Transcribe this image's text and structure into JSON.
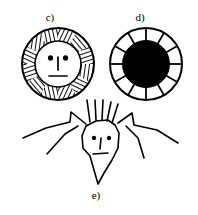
{
  "figure": {
    "background_color": "#ffffff",
    "ink_color": "#000000",
    "width": 198,
    "height": 215,
    "panels": [
      {
        "id": "c",
        "label": "c)",
        "name": "hatched-sun-face",
        "description": "Circle with hatched annulus ring around a blank inner face disc bearing two dot eyes, a vertical nose line and a horizontal mouth line",
        "shape": "annulus",
        "fill_style": "hatched-segments",
        "outer_radius": 36,
        "inner_radius": 23,
        "segment_count": 12,
        "face": {
          "eyes": 2,
          "nose": "vertical-line",
          "mouth": "horizontal-line"
        }
      },
      {
        "id": "d",
        "label": "d)",
        "name": "spoked-solid-disc",
        "description": "Circle with white annulus divided by 12 radial spokes surrounding a solid black inner disc; no face features",
        "shape": "annulus",
        "fill_style": "white-segments-with-spokes",
        "outer_radius": 36,
        "inner_radius": 23,
        "segment_count": 12,
        "inner_fill": "#000000",
        "face": {
          "eyes": 0,
          "nose": "none",
          "mouth": "none"
        }
      },
      {
        "id": "e",
        "label": "e)",
        "name": "spiky-haired-head-with-wings",
        "description": "Sketchy angular head with pointed chin, two dot eyes, nose and mouth, five straight hair spikes on top, and two jagged zig-zag wing or arm strokes extending left and right",
        "shape": "freehand-sketch",
        "hair_spikes": 5,
        "wings": 2,
        "face": {
          "eyes": 2,
          "nose": "vertical-line",
          "mouth": "horizontal-line"
        }
      }
    ]
  }
}
